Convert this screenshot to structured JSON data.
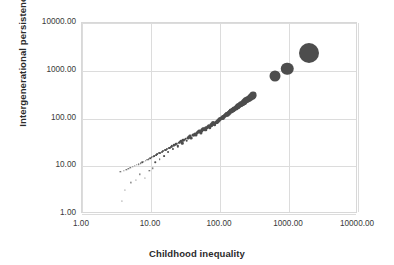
{
  "chart_data": {
    "type": "scatter",
    "title": "",
    "subtitle": "",
    "xlabel": "Childhood inequality",
    "ylabel": "Intergenerational persistence",
    "xscale": "log",
    "yscale": "log",
    "xlim": [
      1,
      10000
    ],
    "ylim": [
      1,
      10000
    ],
    "xticks": [
      "1.00",
      "10.00",
      "100.00",
      "1000.00",
      "10000.00"
    ],
    "yticks": [
      "1.00",
      "10.00",
      "100.00",
      "1000.00",
      "10000.00"
    ],
    "xtick_values": [
      1,
      10,
      100,
      1000,
      10000
    ],
    "ytick_values": [
      1,
      10,
      100,
      1000,
      10000
    ],
    "grid": true,
    "legend": "none",
    "marker_color": "#4d4d4d",
    "marker_size_encodes": "magnitude",
    "series": [
      {
        "name": "countries",
        "points": [
          {
            "x": 3.6,
            "y": 7.6,
            "s": 1.3
          },
          {
            "x": 3.8,
            "y": 1.9,
            "s": 1.2
          },
          {
            "x": 4.0,
            "y": 8.1,
            "s": 1.3
          },
          {
            "x": 4.2,
            "y": 3.2,
            "s": 1.2
          },
          {
            "x": 4.4,
            "y": 8.5,
            "s": 1.3
          },
          {
            "x": 4.7,
            "y": 8.8,
            "s": 1.3
          },
          {
            "x": 5.0,
            "y": 9.2,
            "s": 1.4
          },
          {
            "x": 5.1,
            "y": 4.6,
            "s": 1.2
          },
          {
            "x": 5.4,
            "y": 9.6,
            "s": 1.4
          },
          {
            "x": 5.8,
            "y": 10.1,
            "s": 1.4
          },
          {
            "x": 6.0,
            "y": 5.2,
            "s": 1.2
          },
          {
            "x": 6.2,
            "y": 10.6,
            "s": 1.4
          },
          {
            "x": 6.6,
            "y": 11.0,
            "s": 1.5
          },
          {
            "x": 6.9,
            "y": 6.8,
            "s": 1.3
          },
          {
            "x": 7.1,
            "y": 11.5,
            "s": 1.5
          },
          {
            "x": 7.5,
            "y": 12.0,
            "s": 1.5
          },
          {
            "x": 7.9,
            "y": 12.4,
            "s": 1.5
          },
          {
            "x": 8.1,
            "y": 5.6,
            "s": 1.2
          },
          {
            "x": 8.4,
            "y": 13.0,
            "s": 1.6
          },
          {
            "x": 8.8,
            "y": 13.6,
            "s": 1.6
          },
          {
            "x": 9.2,
            "y": 14.2,
            "s": 1.6
          },
          {
            "x": 9.5,
            "y": 7.9,
            "s": 1.3
          },
          {
            "x": 9.8,
            "y": 14.8,
            "s": 1.7
          },
          {
            "x": 10.2,
            "y": 15.3,
            "s": 1.7
          },
          {
            "x": 10.6,
            "y": 9.0,
            "s": 1.4
          },
          {
            "x": 10.8,
            "y": 16.0,
            "s": 1.7
          },
          {
            "x": 11.2,
            "y": 16.6,
            "s": 1.8
          },
          {
            "x": 11.6,
            "y": 12.2,
            "s": 1.5
          },
          {
            "x": 11.9,
            "y": 17.2,
            "s": 1.8
          },
          {
            "x": 12.4,
            "y": 17.9,
            "s": 1.8
          },
          {
            "x": 12.9,
            "y": 18.5,
            "s": 1.9
          },
          {
            "x": 13.3,
            "y": 14.0,
            "s": 1.6
          },
          {
            "x": 13.7,
            "y": 19.2,
            "s": 1.9
          },
          {
            "x": 14.3,
            "y": 20.0,
            "s": 2.0
          },
          {
            "x": 14.9,
            "y": 20.8,
            "s": 2.0
          },
          {
            "x": 15.4,
            "y": 16.5,
            "s": 1.8
          },
          {
            "x": 15.9,
            "y": 21.6,
            "s": 2.0
          },
          {
            "x": 16.6,
            "y": 22.4,
            "s": 2.1
          },
          {
            "x": 17.2,
            "y": 23.2,
            "s": 2.1
          },
          {
            "x": 17.8,
            "y": 19.8,
            "s": 1.9
          },
          {
            "x": 18.5,
            "y": 24.2,
            "s": 2.2
          },
          {
            "x": 19.3,
            "y": 25.2,
            "s": 2.2
          },
          {
            "x": 20.0,
            "y": 26.2,
            "s": 2.3
          },
          {
            "x": 20.8,
            "y": 22.6,
            "s": 2.1
          },
          {
            "x": 21.6,
            "y": 27.3,
            "s": 2.3
          },
          {
            "x": 22.5,
            "y": 28.4,
            "s": 2.4
          },
          {
            "x": 23.4,
            "y": 29.5,
            "s": 2.4
          },
          {
            "x": 24.3,
            "y": 26.0,
            "s": 2.3
          },
          {
            "x": 25.2,
            "y": 30.8,
            "s": 2.5
          },
          {
            "x": 26.2,
            "y": 32.0,
            "s": 2.5
          },
          {
            "x": 27.3,
            "y": 33.3,
            "s": 2.6
          },
          {
            "x": 28.3,
            "y": 30.0,
            "s": 2.4
          },
          {
            "x": 29.4,
            "y": 34.7,
            "s": 2.6
          },
          {
            "x": 30.6,
            "y": 36.2,
            "s": 2.7
          },
          {
            "x": 31.8,
            "y": 37.7,
            "s": 2.7
          },
          {
            "x": 33.0,
            "y": 34.5,
            "s": 2.6
          },
          {
            "x": 34.3,
            "y": 39.3,
            "s": 2.8
          },
          {
            "x": 35.7,
            "y": 40.9,
            "s": 2.8
          },
          {
            "x": 37.1,
            "y": 42.6,
            "s": 2.9
          },
          {
            "x": 38.5,
            "y": 39.5,
            "s": 2.8
          },
          {
            "x": 40.0,
            "y": 44.4,
            "s": 3.0
          },
          {
            "x": 41.6,
            "y": 46.2,
            "s": 3.0
          },
          {
            "x": 43.2,
            "y": 48.2,
            "s": 3.1
          },
          {
            "x": 44.9,
            "y": 45.0,
            "s": 3.0
          },
          {
            "x": 46.7,
            "y": 50.2,
            "s": 3.1
          },
          {
            "x": 48.5,
            "y": 52.3,
            "s": 3.2
          },
          {
            "x": 50.4,
            "y": 54.5,
            "s": 3.2
          },
          {
            "x": 52.4,
            "y": 51.0,
            "s": 3.1
          },
          {
            "x": 54.5,
            "y": 56.7,
            "s": 3.3
          },
          {
            "x": 56.6,
            "y": 59.1,
            "s": 3.3
          },
          {
            "x": 58.9,
            "y": 61.6,
            "s": 3.4
          },
          {
            "x": 61.2,
            "y": 58.0,
            "s": 3.3
          },
          {
            "x": 63.6,
            "y": 64.2,
            "s": 3.5
          },
          {
            "x": 66.1,
            "y": 66.9,
            "s": 3.5
          },
          {
            "x": 68.7,
            "y": 69.7,
            "s": 3.6
          },
          {
            "x": 71.4,
            "y": 66.0,
            "s": 3.5
          },
          {
            "x": 74.2,
            "y": 72.6,
            "s": 3.6
          },
          {
            "x": 77.2,
            "y": 75.6,
            "s": 3.7
          },
          {
            "x": 80.2,
            "y": 78.8,
            "s": 3.8
          },
          {
            "x": 83.4,
            "y": 75.0,
            "s": 3.7
          },
          {
            "x": 86.7,
            "y": 82.1,
            "s": 3.8
          },
          {
            "x": 90.1,
            "y": 85.6,
            "s": 3.9
          },
          {
            "x": 93.7,
            "y": 89.1,
            "s": 4.0
          },
          {
            "x": 97.4,
            "y": 93.0,
            "s": 4.0
          },
          {
            "x": 101.3,
            "y": 96.8,
            "s": 4.1
          },
          {
            "x": 105.3,
            "y": 101.0,
            "s": 4.2
          },
          {
            "x": 109.5,
            "y": 105.2,
            "s": 4.2
          },
          {
            "x": 113.8,
            "y": 109.6,
            "s": 4.3
          },
          {
            "x": 118.3,
            "y": 114.2,
            "s": 4.4
          },
          {
            "x": 123.0,
            "y": 119.0,
            "s": 4.4
          },
          {
            "x": 127.9,
            "y": 124.0,
            "s": 4.5
          },
          {
            "x": 133.0,
            "y": 129.2,
            "s": 4.6
          },
          {
            "x": 138.3,
            "y": 134.6,
            "s": 4.7
          },
          {
            "x": 143.8,
            "y": 140.2,
            "s": 4.8
          },
          {
            "x": 149.5,
            "y": 146.1,
            "s": 4.8
          },
          {
            "x": 155.5,
            "y": 152.2,
            "s": 4.9
          },
          {
            "x": 161.7,
            "y": 158.6,
            "s": 5.0
          },
          {
            "x": 168.1,
            "y": 165.2,
            "s": 5.1
          },
          {
            "x": 174.9,
            "y": 172.1,
            "s": 5.2
          },
          {
            "x": 181.8,
            "y": 179.3,
            "s": 5.3
          },
          {
            "x": 189.1,
            "y": 186.8,
            "s": 5.4
          },
          {
            "x": 196.7,
            "y": 194.6,
            "s": 5.5
          },
          {
            "x": 204.5,
            "y": 202.8,
            "s": 5.6
          },
          {
            "x": 212.7,
            "y": 211.2,
            "s": 5.7
          },
          {
            "x": 221.2,
            "y": 220.1,
            "s": 5.8
          },
          {
            "x": 230.0,
            "y": 229.3,
            "s": 5.9
          },
          {
            "x": 239.2,
            "y": 238.9,
            "s": 6.0
          },
          {
            "x": 248.8,
            "y": 248.9,
            "s": 6.1
          },
          {
            "x": 258.8,
            "y": 259.3,
            "s": 6.2
          },
          {
            "x": 269.1,
            "y": 270.2,
            "s": 6.3
          },
          {
            "x": 279.9,
            "y": 281.5,
            "s": 6.5
          },
          {
            "x": 291.1,
            "y": 293.3,
            "s": 6.6
          },
          {
            "x": 302.7,
            "y": 305.6,
            "s": 6.8
          },
          {
            "x": 630.0,
            "y": 780.0,
            "s": 11.0
          },
          {
            "x": 950.0,
            "y": 1100.0,
            "s": 12.5
          },
          {
            "x": 1950.0,
            "y": 2300.0,
            "s": 20.0
          }
        ]
      }
    ]
  },
  "axes": {
    "x_title": "Childhood inequality",
    "y_title": "Intergenerational persistence"
  }
}
